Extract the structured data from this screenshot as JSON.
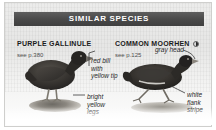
{
  "panel": {
    "header_title": "SIMILAR SPECIES"
  },
  "species": [
    {
      "name": "PURPLE GALLINULE",
      "page_ref": "see p.380",
      "has_range_dot": false,
      "annotations": [
        {
          "id": "red-bill",
          "lines": [
            "red bill",
            "with",
            "yellow tip"
          ]
        },
        {
          "id": "legs",
          "lines": [
            "bright",
            "yellow",
            "legs"
          ]
        }
      ]
    },
    {
      "name": "COMMON MOORHEN",
      "page_ref": "see p.125",
      "has_range_dot": true,
      "annotations": [
        {
          "id": "gray-head",
          "lines": [
            "gray head"
          ]
        },
        {
          "id": "flank",
          "lines": [
            "white",
            "flank",
            "stripe"
          ]
        }
      ]
    }
  ],
  "annotations": {
    "red_bill_1": "red bill",
    "red_bill_2": "with",
    "red_bill_3": "yellow tip",
    "gray_head_1": "gray head",
    "legs_1": "bright",
    "legs_2": "yellow",
    "legs_3": "legs",
    "flank_1": "white",
    "flank_2": "flank",
    "flank_3": "stripe"
  },
  "colors": {
    "header_band": "#4a4a4a",
    "header_text": "#ffffff",
    "plate_bg": "#ececeb",
    "body_text": "#1b1b1b",
    "page_ref_text": "#4f4f4f",
    "bird_dark": "#2e2c2a",
    "leader_line": "#3a3a3a"
  },
  "icons": {
    "range_dot": "range-map-dot-icon"
  }
}
